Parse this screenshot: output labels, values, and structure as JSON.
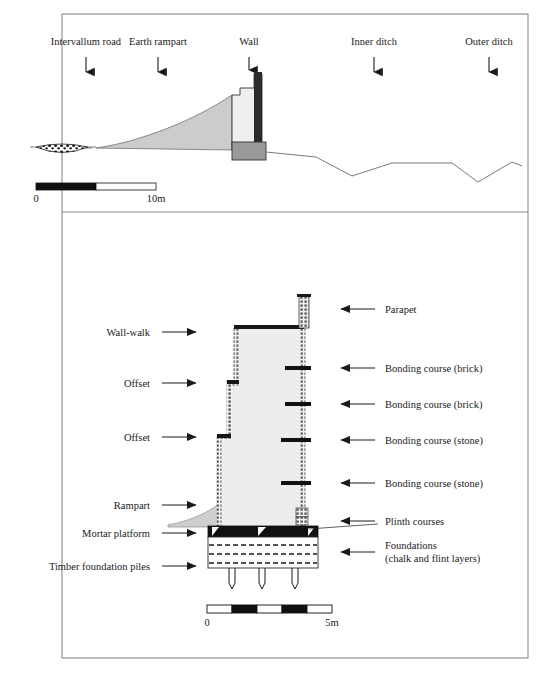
{
  "figure": {
    "type": "archaeological-cross-section",
    "panels": 2
  },
  "upper_panel": {
    "name": "defences-profile",
    "labels": [
      {
        "id": "intervallum-road",
        "text": "Intervallum road",
        "x": 86,
        "arrow": "down"
      },
      {
        "id": "earth-rampart",
        "text": "Earth rampart",
        "x": 158,
        "arrow": "down"
      },
      {
        "id": "wall",
        "text": "Wall",
        "x": 249,
        "arrow": "down"
      },
      {
        "id": "inner-ditch",
        "text": "Inner ditch",
        "x": 374,
        "arrow": "down"
      },
      {
        "id": "outer-ditch",
        "text": "Outer ditch",
        "x": 489,
        "arrow": "down"
      }
    ],
    "scale": {
      "start": "0",
      "end": "10m",
      "segments": 2
    }
  },
  "lower_panel": {
    "name": "wall-construction-detail",
    "left_labels": [
      {
        "id": "wall-walk",
        "text": "Wall-walk",
        "y": 333,
        "arrow": "right"
      },
      {
        "id": "offset-upper",
        "text": "Offset",
        "y": 383,
        "arrow": "right"
      },
      {
        "id": "offset-lower",
        "text": "Offset",
        "y": 437,
        "arrow": "right"
      },
      {
        "id": "rampart",
        "text": "Rampart",
        "y": 505,
        "arrow": "right"
      },
      {
        "id": "mortar-platform",
        "text": "Mortar platform",
        "y": 533,
        "arrow": "right"
      },
      {
        "id": "timber-foundation-piles",
        "text": "Timber foundation piles",
        "y": 566,
        "arrow": "right"
      }
    ],
    "right_labels": [
      {
        "id": "parapet",
        "text": "Parapet",
        "y": 309,
        "arrow": "left"
      },
      {
        "id": "bonding-course-brick-1",
        "text": "Bonding course (brick)",
        "y": 368,
        "arrow": "left"
      },
      {
        "id": "bonding-course-brick-2",
        "text": "Bonding course (brick)",
        "y": 404,
        "arrow": "left"
      },
      {
        "id": "bonding-course-stone-1",
        "text": "Bonding course (stone)",
        "y": 440,
        "arrow": "left"
      },
      {
        "id": "bonding-course-stone-2",
        "text": "Bonding course (stone)",
        "y": 483,
        "arrow": "left"
      },
      {
        "id": "plinth-courses",
        "text": "Plinth courses",
        "y": 521,
        "arrow": "left"
      },
      {
        "id": "foundations-line1",
        "text": "Foundations",
        "y": 545,
        "arrow": "left"
      },
      {
        "id": "foundations-line2",
        "text": "(chalk and flint  layers)",
        "y": 558,
        "arrow": "none"
      }
    ],
    "scale": {
      "start": "0",
      "end": "5m",
      "segments": 5
    }
  },
  "colors": {
    "ink": "#1a1a1a",
    "rampart_fill": "#c9c9c9",
    "wall_fill": "#eeeeee",
    "plinth_fill": "#9a9a9a",
    "masonry_dots": "#555555",
    "frame": "#8a8a8a"
  }
}
